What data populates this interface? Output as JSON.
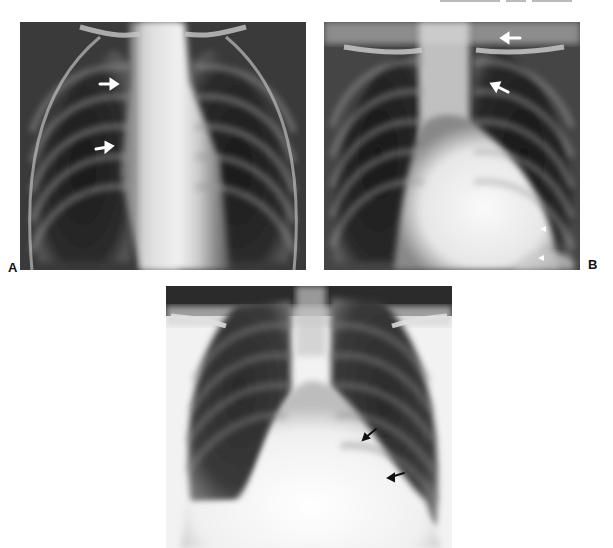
{
  "figure": {
    "panels": [
      {
        "id": "A",
        "label": "A",
        "bounds": {
          "x": 20,
          "y": 22,
          "w": 286,
          "h": 248
        },
        "arrows": [
          {
            "type": "white-arrow",
            "direction": "right",
            "x1": 100,
            "y1": 84,
            "x2": 117,
            "y2": 84
          },
          {
            "type": "white-arrow",
            "direction": "right",
            "x1": 96,
            "y1": 149,
            "x2": 111,
            "y2": 147
          }
        ]
      },
      {
        "id": "B",
        "label": "B",
        "bounds": {
          "x": 324,
          "y": 22,
          "w": 256,
          "h": 248
        },
        "arrows": [
          {
            "type": "white-arrow",
            "direction": "left",
            "x1": 520,
            "y1": 38,
            "x2": 503,
            "y2": 38
          },
          {
            "type": "white-arrow",
            "direction": "up-left",
            "x1": 508,
            "y1": 92,
            "x2": 494,
            "y2": 85
          },
          {
            "type": "white-arrowhead",
            "direction": "left",
            "x": 543,
            "y": 229
          },
          {
            "type": "white-arrowhead",
            "direction": "left",
            "x": 541,
            "y": 258
          }
        ]
      },
      {
        "id": "C",
        "label": "",
        "bounds": {
          "x": 166,
          "y": 286,
          "w": 286,
          "h": 262
        },
        "arrows": [
          {
            "type": "black-arrow",
            "direction": "down-left",
            "x1": 376,
            "y1": 429,
            "x2": 364,
            "y2": 439
          },
          {
            "type": "black-arrow",
            "direction": "left",
            "x1": 404,
            "y1": 473,
            "x2": 389,
            "y2": 478
          }
        ]
      }
    ],
    "image_description": "Three frontal chest radiographs (A, B, C) with arrow annotations"
  },
  "colors": {
    "background": "#ffffff",
    "lung_dark": "#1e1e1e",
    "mediastinum": "#efefef",
    "label": "#111111"
  }
}
